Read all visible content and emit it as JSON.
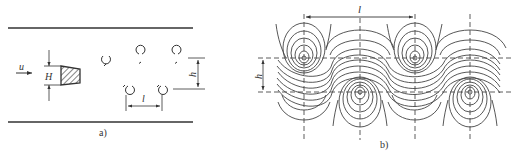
{
  "panel_a": {
    "caption": "a)",
    "labels": {
      "velocity": "u",
      "obstacle_height": "H",
      "street_width": "h",
      "vortex_spacing": "l"
    },
    "description": "Flow past a bluff body in a channel shedding a Kármán vortex street",
    "upper_row_vortices": 3,
    "lower_row_vortices": 2
  },
  "panel_b": {
    "caption": "b)",
    "labels": {
      "vortex_spacing": "l",
      "street_width": "h"
    },
    "description": "Streamline pattern of the Kármán vortex street",
    "upper_row_vortex_x": [
      304,
      415
    ],
    "lower_row_vortex_x": [
      360,
      470
    ]
  },
  "colors": {
    "line": "#333333",
    "background": "#ffffff"
  }
}
